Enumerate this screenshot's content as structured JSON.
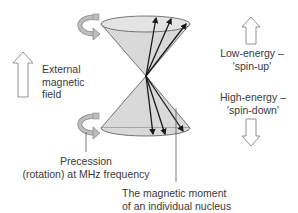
{
  "diagram": {
    "labels": {
      "external_field": [
        "External",
        "magnetic",
        "field"
      ],
      "low_energy": [
        "Low-energy –",
        "'spin-up'"
      ],
      "high_energy": [
        "High-energy –",
        "'spin-down'"
      ],
      "precession": [
        "Precession",
        "(rotation) at MHz frequency"
      ],
      "magnetic_moment": [
        "The magnetic moment",
        "of an individual nucleus"
      ]
    },
    "colors": {
      "cone_fill": "#d9d9d9",
      "cone_stroke": "#555555",
      "vector": "#1a1a1a",
      "arrow_outline": "#777777",
      "rotation_arrow": "#a8a8a8",
      "text": "#3a3a3a"
    },
    "elements": {
      "upper_cone": "spin-up precession cone",
      "lower_cone": "spin-down precession cone",
      "up_vectors": 3,
      "down_vectors": 3
    }
  }
}
